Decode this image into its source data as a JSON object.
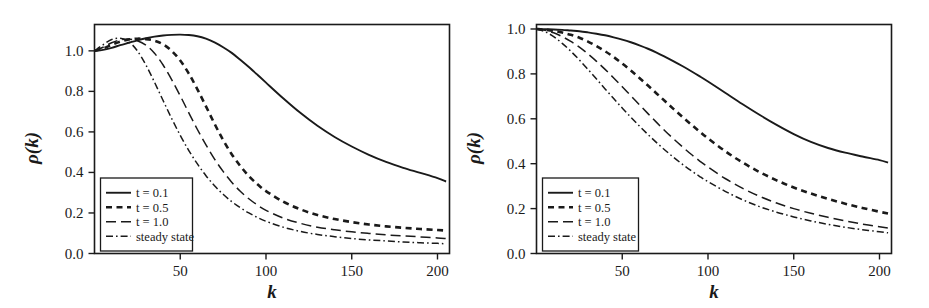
{
  "figure": {
    "background": "#ffffff",
    "ink_color": "#1a1a1a",
    "panel_count": 2
  },
  "chart_data": [
    {
      "type": "line",
      "panel": "left",
      "title": "",
      "xlabel": "k",
      "ylabel": "ρ(k)",
      "xlim": [
        0,
        207
      ],
      "ylim": [
        0.0,
        1.13
      ],
      "xticks": [
        50,
        100,
        150,
        200
      ],
      "xtick_labels": [
        "50",
        "100",
        "150",
        "200"
      ],
      "yticks": [
        0.0,
        0.2,
        0.4,
        0.6,
        0.8,
        1.0
      ],
      "ytick_labels": [
        "0.0",
        "0.2",
        "0.4",
        "0.6",
        "0.8",
        "1.0"
      ],
      "grid": false,
      "legend_position": "lower-left",
      "x": [
        0,
        5,
        10,
        15,
        20,
        25,
        30,
        35,
        40,
        45,
        50,
        55,
        60,
        65,
        70,
        75,
        80,
        85,
        90,
        95,
        100,
        110,
        120,
        130,
        140,
        150,
        160,
        170,
        180,
        190,
        200,
        205
      ],
      "series": [
        {
          "name": "t = 0.1",
          "style": "solid",
          "values": [
            1.0,
            1.005,
            1.015,
            1.028,
            1.04,
            1.052,
            1.062,
            1.07,
            1.076,
            1.079,
            1.08,
            1.078,
            1.072,
            1.06,
            1.042,
            1.018,
            0.99,
            0.956,
            0.92,
            0.882,
            0.843,
            0.766,
            0.694,
            0.63,
            0.575,
            0.528,
            0.487,
            0.452,
            0.423,
            0.398,
            0.372,
            0.355
          ]
        },
        {
          "name": "t = 0.5",
          "style": "dashed",
          "values": [
            1.0,
            1.012,
            1.03,
            1.046,
            1.056,
            1.06,
            1.058,
            1.05,
            1.032,
            1.0,
            0.952,
            0.888,
            0.81,
            0.726,
            0.64,
            0.56,
            0.49,
            0.432,
            0.382,
            0.342,
            0.308,
            0.256,
            0.218,
            0.19,
            0.17,
            0.155,
            0.143,
            0.134,
            0.127,
            0.121,
            0.116,
            0.113
          ]
        },
        {
          "name": "t = 1.0",
          "style": "longdash",
          "values": [
            1.0,
            1.018,
            1.04,
            1.054,
            1.058,
            1.05,
            1.028,
            0.988,
            0.93,
            0.858,
            0.778,
            0.694,
            0.612,
            0.536,
            0.466,
            0.405,
            0.352,
            0.307,
            0.27,
            0.239,
            0.213,
            0.175,
            0.149,
            0.13,
            0.117,
            0.107,
            0.099,
            0.092,
            0.087,
            0.082,
            0.077,
            0.074
          ]
        },
        {
          "name": "steady state",
          "style": "dashdot",
          "values": [
            1.0,
            1.03,
            1.056,
            1.062,
            1.045,
            1.0,
            0.93,
            0.845,
            0.755,
            0.666,
            0.583,
            0.508,
            0.442,
            0.384,
            0.334,
            0.292,
            0.256,
            0.226,
            0.2,
            0.178,
            0.159,
            0.13,
            0.109,
            0.094,
            0.083,
            0.074,
            0.067,
            0.062,
            0.057,
            0.053,
            0.05,
            0.048
          ]
        }
      ]
    },
    {
      "type": "line",
      "panel": "right",
      "title": "",
      "xlabel": "k",
      "ylabel": "ρ(k)",
      "xlim": [
        0,
        207
      ],
      "ylim": [
        0.0,
        1.02
      ],
      "xticks": [
        50,
        100,
        150,
        200
      ],
      "xtick_labels": [
        "50",
        "100",
        "150",
        "200"
      ],
      "yticks": [
        0.0,
        0.2,
        0.4,
        0.6,
        0.8,
        1.0
      ],
      "ytick_labels": [
        "0.0",
        "0.2",
        "0.4",
        "0.6",
        "0.8",
        "1.0"
      ],
      "grid": false,
      "legend_position": "lower-left",
      "x": [
        0,
        5,
        10,
        15,
        20,
        25,
        30,
        35,
        40,
        45,
        50,
        55,
        60,
        65,
        70,
        75,
        80,
        85,
        90,
        95,
        100,
        110,
        120,
        130,
        140,
        150,
        160,
        170,
        180,
        190,
        200,
        205
      ],
      "series": [
        {
          "name": "t = 0.1",
          "style": "solid",
          "values": [
            1.0,
            0.999,
            0.998,
            0.996,
            0.993,
            0.99,
            0.985,
            0.979,
            0.972,
            0.963,
            0.953,
            0.941,
            0.927,
            0.912,
            0.895,
            0.876,
            0.856,
            0.835,
            0.813,
            0.79,
            0.766,
            0.716,
            0.666,
            0.618,
            0.573,
            0.532,
            0.497,
            0.47,
            0.449,
            0.432,
            0.416,
            0.405
          ]
        },
        {
          "name": "t = 0.5",
          "style": "dashed",
          "values": [
            1.0,
            0.997,
            0.992,
            0.984,
            0.974,
            0.961,
            0.944,
            0.924,
            0.901,
            0.875,
            0.846,
            0.815,
            0.782,
            0.748,
            0.713,
            0.678,
            0.643,
            0.609,
            0.576,
            0.544,
            0.513,
            0.456,
            0.406,
            0.363,
            0.326,
            0.294,
            0.267,
            0.243,
            0.222,
            0.203,
            0.186,
            0.178
          ]
        },
        {
          "name": "t = 1.0",
          "style": "longdash",
          "values": [
            1.0,
            0.994,
            0.983,
            0.966,
            0.945,
            0.919,
            0.889,
            0.856,
            0.82,
            0.782,
            0.743,
            0.703,
            0.663,
            0.623,
            0.584,
            0.546,
            0.51,
            0.476,
            0.443,
            0.413,
            0.385,
            0.334,
            0.291,
            0.255,
            0.225,
            0.2,
            0.179,
            0.161,
            0.145,
            0.131,
            0.119,
            0.113
          ]
        },
        {
          "name": "steady state",
          "style": "dashdot",
          "values": [
            1.0,
            0.988,
            0.966,
            0.936,
            0.901,
            0.862,
            0.82,
            0.777,
            0.733,
            0.69,
            0.648,
            0.607,
            0.568,
            0.53,
            0.494,
            0.46,
            0.428,
            0.398,
            0.37,
            0.344,
            0.32,
            0.277,
            0.24,
            0.209,
            0.184,
            0.163,
            0.145,
            0.13,
            0.117,
            0.106,
            0.097,
            0.092
          ]
        }
      ]
    }
  ],
  "legend": {
    "entries": [
      {
        "label": "t = 0.1",
        "style": "solid"
      },
      {
        "label": "t = 0.5",
        "style": "dashed"
      },
      {
        "label": "t = 1.0",
        "style": "longdash"
      },
      {
        "label": "steady state",
        "style": "dashdot"
      }
    ]
  }
}
